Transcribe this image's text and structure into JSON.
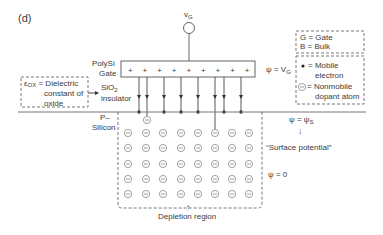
{
  "panel_label": "(d)",
  "terminal": {
    "label": "v",
    "sub": "G"
  },
  "gate": {
    "label_line1": "PolySi",
    "label_line2": "Gate",
    "plus_sign": "+",
    "plus_count": 9,
    "potential_label": "ψ = V",
    "potential_sub": "G"
  },
  "insulator": {
    "label_line1": "SiO",
    "label_sub": "2",
    "label_line2": "insulator"
  },
  "dielectric_note": {
    "symbol": "ε",
    "symbol_sub": "OX",
    "line1": " = Dielectric",
    "line2": "constant of",
    "line3": "oxide"
  },
  "substrate": {
    "label_line1": "P–",
    "label_line2": "Silicon"
  },
  "surface": {
    "potential_label": "ψ = ψ",
    "potential_sub": "S",
    "arrow": "↓",
    "caption": "“Surface potential”",
    "bulk_potential": "ψ = 0"
  },
  "depletion": {
    "arrow": "↑",
    "label": "Depletion region"
  },
  "legend": {
    "box1": [
      "G = Gate",
      "B = Bulk"
    ],
    "box2": [
      {
        "symbol": "dot",
        "line1": "= Mobile",
        "line2": "electron"
      },
      {
        "symbol": "ion",
        "line1": "= Nonmobile",
        "line2": "dopant atom"
      }
    ]
  },
  "field_lines": {
    "x": [
      139,
      147,
      164,
      181,
      198,
      215,
      224,
      241
    ],
    "ends_on_ion": [
      147,
      215
    ]
  },
  "ion_grid": {
    "columns": [
      128,
      146,
      163,
      181,
      198,
      215,
      232,
      249
    ],
    "rows": [
      133,
      148,
      164,
      179,
      194
    ],
    "extra_ion": {
      "x": 147,
      "y": 120
    }
  }
}
